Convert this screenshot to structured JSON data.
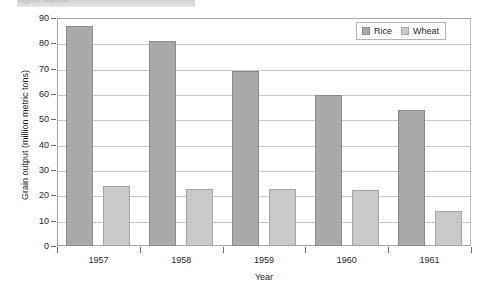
{
  "header": {
    "ghost_text": "figure caption"
  },
  "chart_data": {
    "type": "bar",
    "title": "",
    "xlabel": "Year",
    "ylabel": "Grain output (million metric tons)",
    "categories": [
      "1957",
      "1958",
      "1959",
      "1960",
      "1961"
    ],
    "series": [
      {
        "name": "Rice",
        "color": "#a9a9a9",
        "values": [
          87,
          81,
          69,
          59.5,
          53.5
        ]
      },
      {
        "name": "Wheat",
        "color": "#c9c9c9",
        "values": [
          23.5,
          22.5,
          22.5,
          22,
          14
        ]
      }
    ],
    "ylim": [
      0,
      90
    ],
    "yticks": [
      0,
      10,
      20,
      30,
      40,
      50,
      60,
      70,
      80,
      90
    ],
    "grid": true,
    "legend_position": "top-right"
  }
}
